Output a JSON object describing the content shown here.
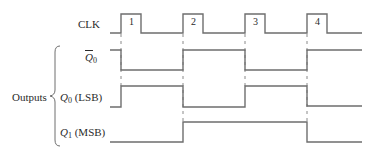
{
  "diagram": {
    "type": "timing-diagram",
    "colors": {
      "line": "#6e6e6e",
      "text": "#2a2a2a",
      "dash": "#8a8a8a"
    },
    "clock": {
      "label": "CLK",
      "pulse_labels": [
        "1",
        "2",
        "3",
        "4"
      ]
    },
    "group_label": "Outputs",
    "signals": [
      {
        "id": "q0_bar",
        "name": "Q",
        "subscript": "0",
        "overbar": true,
        "suffix": ""
      },
      {
        "id": "q0",
        "name": "Q",
        "subscript": "0",
        "overbar": false,
        "suffix": " (LSB)"
      },
      {
        "id": "q1",
        "name": "Q",
        "subscript": "1",
        "overbar": false,
        "suffix": " (MSB)"
      }
    ],
    "waveforms": {
      "CLK": [
        0,
        1,
        0,
        1,
        0,
        1,
        0,
        1,
        0
      ],
      "Q0_bar": [
        1,
        0,
        1,
        0,
        1
      ],
      "Q0": [
        0,
        1,
        0,
        1,
        0
      ],
      "Q1": [
        0,
        0,
        1,
        1,
        0
      ]
    }
  }
}
